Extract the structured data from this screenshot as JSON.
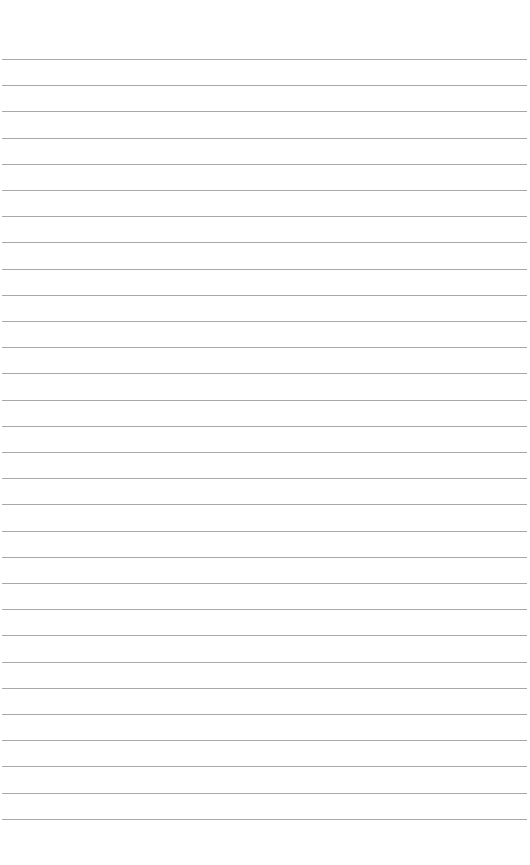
{
  "page": {
    "type": "lined-paper",
    "background_color": "#ffffff",
    "line_color": "#a8a8a8",
    "line_count": 30,
    "first_line_y": 59,
    "line_spacing": 26.2,
    "line_left": 2,
    "line_right": 527
  }
}
